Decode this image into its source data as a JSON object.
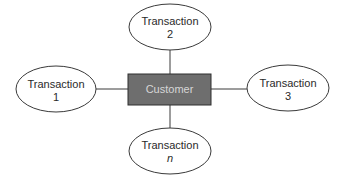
{
  "diagram": {
    "type": "entity-relationship star",
    "center": {
      "label": "Customer",
      "fill": "#6e6e6e",
      "text_color": "#d6d6d6"
    },
    "nodes": [
      {
        "id": "t1",
        "line1": "Transaction",
        "line2": "1",
        "position": "left"
      },
      {
        "id": "t2",
        "line1": "Transaction",
        "line2": "2",
        "position": "top"
      },
      {
        "id": "t3",
        "line1": "Transaction",
        "line2": "3",
        "position": "right"
      },
      {
        "id": "tn",
        "line1": "Transaction",
        "line2": "n",
        "position": "bottom",
        "line2_italic": true
      }
    ]
  }
}
